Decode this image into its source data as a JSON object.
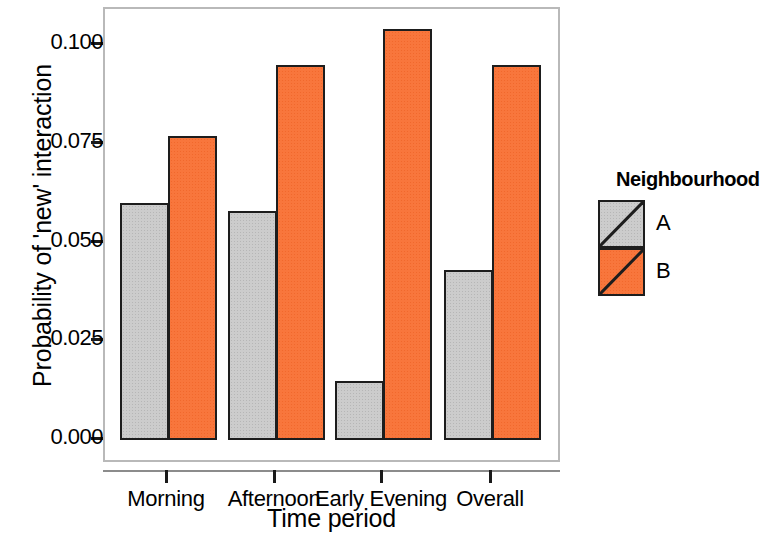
{
  "chart_data": {
    "type": "bar",
    "title": "",
    "xlabel": "Time period",
    "ylabel": "Probability of 'new' interaction",
    "categories": [
      "Morning",
      "Afternoon",
      "Early Evening",
      "Overall"
    ],
    "series": [
      {
        "name": "A",
        "color": "#cccccc",
        "values": [
          0.06,
          0.058,
          0.015,
          0.043
        ]
      },
      {
        "name": "B",
        "color": "#f8763c",
        "values": [
          0.077,
          0.095,
          0.104,
          0.095
        ]
      }
    ],
    "ylim": [
      0.0,
      0.11
    ],
    "yticks": [
      0.0,
      0.025,
      0.05,
      0.075,
      0.1
    ],
    "ytick_labels": [
      "0.000",
      "0.025",
      "0.050",
      "0.075",
      "0.100"
    ],
    "grid": false,
    "legend": {
      "title": "Neighbourhood",
      "position": "right",
      "entries": [
        {
          "label": "A",
          "color": "#cccccc"
        },
        {
          "label": "B",
          "color": "#f8763c"
        }
      ]
    }
  },
  "axes": {
    "y_title": "Probability of 'new' interaction",
    "x_title": "Time period"
  },
  "colors": {
    "series_a": "#cccccc",
    "series_b": "#f8763c",
    "outline": "#1d1d1d",
    "frame": "#b9b9b9"
  }
}
